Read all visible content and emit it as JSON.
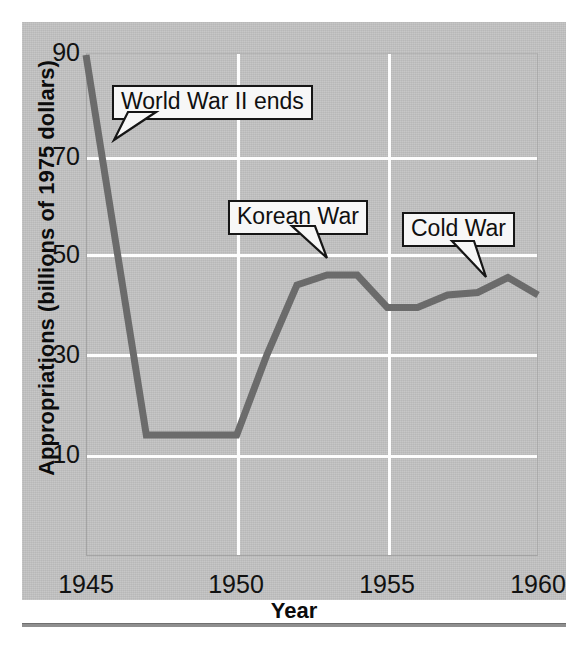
{
  "figure": {
    "background_color": "#c3c3c3",
    "line_color": "#6b6b6b"
  },
  "chart_data": {
    "type": "line",
    "title": "",
    "xlabel": "Year",
    "ylabel": "Appropriations (billions of 1975 dollars)",
    "xlim": [
      1945,
      1960
    ],
    "ylim": [
      0,
      95
    ],
    "xticks": [
      "1945",
      "1950",
      "1955",
      "1960"
    ],
    "xtick_values": [
      1945,
      1950,
      1955,
      1960
    ],
    "yticks": [
      "10",
      "30",
      "50",
      "70",
      "90"
    ],
    "ytick_values": [
      10,
      30,
      50,
      70,
      90
    ],
    "grid": true,
    "grid_color": "#ffffff",
    "legend": "none",
    "x": [
      1945,
      1946,
      1947,
      1948,
      1949,
      1950,
      1951,
      1952,
      1953,
      1954,
      1955,
      1956,
      1957,
      1958,
      1959,
      1960
    ],
    "values": [
      90,
      52,
      14,
      14,
      14,
      14,
      30,
      44,
      46,
      46,
      39.5,
      39.5,
      42,
      42.5,
      45.5,
      42
    ],
    "series": [
      {
        "name": "Appropriations",
        "values": [
          90,
          52,
          14,
          14,
          14,
          14,
          30,
          44,
          46,
          46,
          39.5,
          39.5,
          42,
          42.5,
          45.5,
          42
        ]
      }
    ],
    "annotations": [
      {
        "label": "World War II ends",
        "points_to_year": 1946,
        "points_to_value": 76
      },
      {
        "label": "Korean War",
        "points_to_year": 1953,
        "points_to_value": 49
      },
      {
        "label": "Cold War",
        "points_to_year": 1959,
        "points_to_value": 45
      }
    ]
  },
  "axis": {
    "y_title": "Appropriations (billions of 1975 dollars)",
    "x_title": "Year",
    "y_ticks": [
      {
        "label": "90",
        "value": 90
      },
      {
        "label": "70",
        "value": 70
      },
      {
        "label": "50",
        "value": 50
      },
      {
        "label": "30",
        "value": 30
      },
      {
        "label": "10",
        "value": 10
      }
    ],
    "x_ticks": [
      {
        "label": "1945",
        "value": 1945
      },
      {
        "label": "1950",
        "value": 1950
      },
      {
        "label": "1955",
        "value": 1955
      },
      {
        "label": "1960",
        "value": 1960
      }
    ]
  },
  "callouts": {
    "ww2": "World War II ends",
    "korea": "Korean War",
    "cold": "Cold War"
  }
}
